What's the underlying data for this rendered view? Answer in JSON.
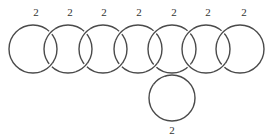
{
  "diagram": {
    "type": "link-diagram",
    "stroke_color": "#4a4a4a",
    "label_color": "#333333",
    "rings": [
      {
        "id": "ring-1",
        "cx": 33,
        "cy": 49,
        "r": 24,
        "label": "2",
        "label_x": 36,
        "label_y": 16
      },
      {
        "id": "ring-2",
        "cx": 68,
        "cy": 49,
        "r": 24,
        "label": "2",
        "label_x": 70,
        "label_y": 16
      },
      {
        "id": "ring-3",
        "cx": 103,
        "cy": 49,
        "r": 24,
        "label": "2",
        "label_x": 104,
        "label_y": 16
      },
      {
        "id": "ring-4",
        "cx": 138,
        "cy": 49,
        "r": 24,
        "label": "2",
        "label_x": 139,
        "label_y": 16
      },
      {
        "id": "ring-5",
        "cx": 172,
        "cy": 49,
        "r": 24,
        "label": "2",
        "label_x": 174,
        "label_y": 16
      },
      {
        "id": "ring-6",
        "cx": 206,
        "cy": 49,
        "r": 24,
        "label": "2",
        "label_x": 208,
        "label_y": 16
      },
      {
        "id": "ring-7",
        "cx": 240,
        "cy": 49,
        "r": 24,
        "label": "2",
        "label_x": 244,
        "label_y": 16
      },
      {
        "id": "ring-8",
        "cx": 172,
        "cy": 98,
        "r": 23,
        "label": "2",
        "label_x": 172,
        "label_y": 134
      }
    ],
    "labels": [
      "2",
      "2",
      "2",
      "2",
      "2",
      "2",
      "2",
      "2"
    ]
  }
}
